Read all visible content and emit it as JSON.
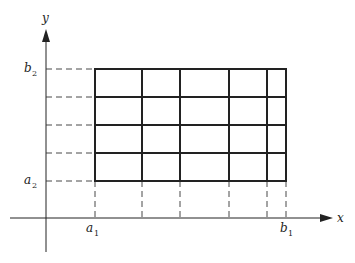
{
  "diagram": {
    "type": "partition-grid",
    "axes": {
      "x_label": "x",
      "y_label": "y"
    },
    "labels": {
      "a1": {
        "main": "a",
        "sub": "1"
      },
      "b1": {
        "main": "b",
        "sub": "1"
      },
      "a2": {
        "main": "a",
        "sub": "2"
      },
      "b2": {
        "main": "b",
        "sub": "2"
      }
    },
    "grid": {
      "columns_px": [
        95,
        142,
        180,
        229,
        267,
        286
      ],
      "rows_px": [
        69,
        97,
        125,
        153,
        181
      ],
      "cells_x": 5,
      "cells_y": 4
    },
    "colors": {
      "line": "#222222",
      "background": "#ffffff"
    }
  }
}
